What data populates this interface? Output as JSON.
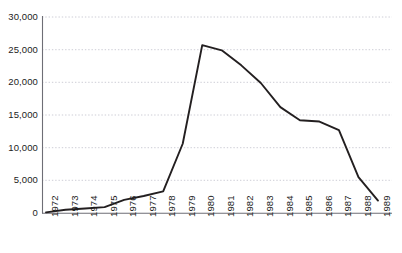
{
  "chart_data": {
    "type": "line",
    "title": "",
    "subtitle": "",
    "xlabel": "",
    "ylabel": "",
    "x": [
      "1972",
      "1973",
      "1974",
      "1975",
      "1976",
      "1977",
      "1978",
      "1979",
      "1980",
      "1981",
      "1982",
      "1983",
      "1984",
      "1985",
      "1986",
      "1987",
      "1988",
      "1989"
    ],
    "categories": [
      "1972",
      "1973",
      "1974",
      "1975",
      "1976",
      "1977",
      "1978",
      "1979",
      "1980",
      "1981",
      "1982",
      "1983",
      "1984",
      "1985",
      "1986",
      "1987",
      "1988",
      "1989"
    ],
    "values": [
      100,
      500,
      700,
      900,
      2000,
      2600,
      3300,
      10600,
      25700,
      24900,
      22600,
      19900,
      16200,
      14200,
      14000,
      12700,
      5500,
      1900
    ],
    "series": [
      {
        "name": "",
        "values": [
          100,
          500,
          700,
          900,
          2000,
          2600,
          3300,
          10600,
          25700,
          24900,
          22600,
          19900,
          16200,
          14200,
          14000,
          12700,
          5500,
          1900
        ]
      }
    ],
    "ylim": [
      0,
      30000
    ],
    "ytick_values": [
      0,
      5000,
      10000,
      15000,
      20000,
      25000,
      30000
    ],
    "ytick_labels": [
      "0",
      "5,000",
      "10,000",
      "15,000",
      "20,000",
      "25,000",
      "30,000"
    ],
    "grid": "horizontal-dotted",
    "legend": "none",
    "line_color": "#231f20",
    "grid_color": "#b8b8c4",
    "axis_color": "#6e6e76",
    "background_color": "#ffffff",
    "xtick_rotation": 90
  }
}
